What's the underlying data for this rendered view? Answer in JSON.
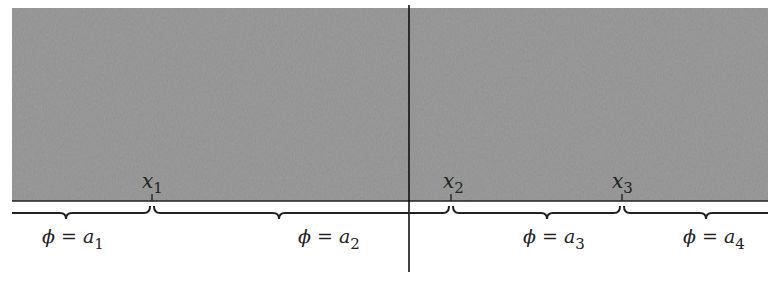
{
  "diagram": {
    "region": {
      "fill": "#8c8c8c",
      "x0": 12,
      "x1": 768,
      "y0": 8,
      "y1": 201
    },
    "axis_line_y": 201,
    "divider_x": 409,
    "points": [
      {
        "label": "x",
        "sub": "1",
        "x": 152
      },
      {
        "label": "x",
        "sub": "2",
        "x": 451
      },
      {
        "label": "x",
        "sub": "3",
        "x": 622
      }
    ],
    "intervals": [
      {
        "label": "ϕ = a",
        "sub": "1",
        "x0": 12,
        "x1": 150
      },
      {
        "label": "ϕ = a",
        "sub": "2",
        "x0": 154,
        "x1": 449
      },
      {
        "label": "ϕ = a",
        "sub": "3",
        "x0": 453,
        "x1": 620
      },
      {
        "label": "ϕ = a",
        "sub": "4",
        "x0": 624,
        "x1": 768
      }
    ]
  }
}
